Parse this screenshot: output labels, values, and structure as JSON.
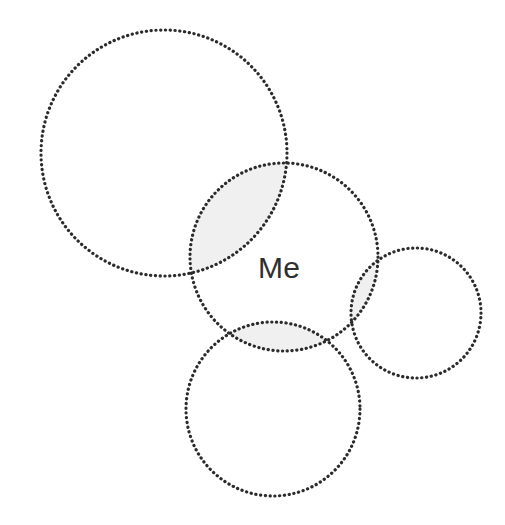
{
  "diagram": {
    "type": "venn-diagram",
    "title": "",
    "background_color": "#ffffff",
    "stroke_color": "#2b2b2b",
    "stroke_style": "dotted",
    "overlap_fill_color": "#f0f0f0",
    "canvas": {
      "width": 505,
      "height": 525
    },
    "labels": [
      {
        "id": "me",
        "text": "Me",
        "x": 258,
        "y": 278,
        "font_size": 30,
        "color": "#2f2f2f"
      }
    ],
    "circles": [
      {
        "id": "upper-left-circle",
        "name": "upper-left-circle",
        "label": "",
        "cx": 164,
        "cy": 153,
        "r": 123
      },
      {
        "id": "me-circle",
        "name": "me-circle",
        "label": "Me",
        "cx": 284,
        "cy": 257,
        "r": 94
      },
      {
        "id": "bottom-circle",
        "name": "bottom-circle",
        "label": "",
        "cx": 273,
        "cy": 409,
        "r": 87
      },
      {
        "id": "right-small-circle",
        "name": "right-small-circle",
        "label": "",
        "cx": 416,
        "cy": 313,
        "r": 65
      }
    ],
    "overlaps": [
      {
        "id": "overlap-me-upperleft",
        "between": [
          "me-circle",
          "upper-left-circle"
        ],
        "fill": "#f0f0f0"
      },
      {
        "id": "overlap-me-bottom",
        "between": [
          "me-circle",
          "bottom-circle"
        ],
        "fill": "#f0f0f0"
      },
      {
        "id": "overlap-me-right",
        "between": [
          "me-circle",
          "right-small-circle"
        ],
        "fill": "#f0f0f0"
      }
    ]
  }
}
